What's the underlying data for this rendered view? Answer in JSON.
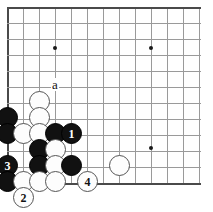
{
  "figure": {
    "kind": "go-board-diagram",
    "title": "",
    "board": {
      "origin_x": 7,
      "origin_y": 7,
      "cell": 16,
      "cols": 13,
      "rows": 12,
      "line_color": "#9a9a9a",
      "edge_color": "#4a4a4a",
      "background": "#ffffff"
    },
    "star_points": [
      {
        "x": 55,
        "y": 48
      },
      {
        "x": 151,
        "y": 48
      },
      {
        "x": 151,
        "y": 148
      }
    ],
    "labels": [
      {
        "name": "point-label-a",
        "text": "a",
        "x": 55,
        "y": 85
      }
    ],
    "stones": [
      {
        "id": "w-39-101",
        "color": "white",
        "x": 39,
        "y": 101,
        "number": ""
      },
      {
        "id": "b-7-117",
        "color": "black",
        "x": 7,
        "y": 117,
        "number": ""
      },
      {
        "id": "w-39-117",
        "color": "white",
        "x": 39,
        "y": 117,
        "number": ""
      },
      {
        "id": "b-7-133",
        "color": "black",
        "x": 7,
        "y": 133,
        "number": ""
      },
      {
        "id": "w-23-133",
        "color": "white",
        "x": 23,
        "y": 133,
        "number": ""
      },
      {
        "id": "w-39-133",
        "color": "white",
        "x": 39,
        "y": 133,
        "number": ""
      },
      {
        "id": "b-55-133",
        "color": "black",
        "x": 55,
        "y": 133,
        "number": ""
      },
      {
        "id": "b-71-133",
        "color": "black",
        "x": 71,
        "y": 133,
        "number": "1"
      },
      {
        "id": "b-39-149",
        "color": "black",
        "x": 39,
        "y": 149,
        "number": ""
      },
      {
        "id": "w-55-149",
        "color": "white",
        "x": 55,
        "y": 149,
        "number": ""
      },
      {
        "id": "b-7-165",
        "color": "black",
        "x": 7,
        "y": 165,
        "number": "3"
      },
      {
        "id": "b-39-165",
        "color": "black",
        "x": 39,
        "y": 165,
        "number": ""
      },
      {
        "id": "w-55-165",
        "color": "white",
        "x": 55,
        "y": 165,
        "number": ""
      },
      {
        "id": "b-71-165",
        "color": "black",
        "x": 71,
        "y": 165,
        "number": ""
      },
      {
        "id": "w-119-165",
        "color": "white",
        "x": 119,
        "y": 165,
        "number": ""
      },
      {
        "id": "b-7-181",
        "color": "black",
        "x": 7,
        "y": 181,
        "number": ""
      },
      {
        "id": "w-23-181",
        "color": "white",
        "x": 23,
        "y": 181,
        "number": ""
      },
      {
        "id": "w-39-181",
        "color": "white",
        "x": 39,
        "y": 181,
        "number": ""
      },
      {
        "id": "w-55-181",
        "color": "white",
        "x": 55,
        "y": 181,
        "number": ""
      },
      {
        "id": "w-87-181",
        "color": "white",
        "x": 87,
        "y": 181,
        "number": "4"
      },
      {
        "id": "w-23-197",
        "color": "white",
        "x": 23,
        "y": 197,
        "number": "2"
      }
    ]
  }
}
